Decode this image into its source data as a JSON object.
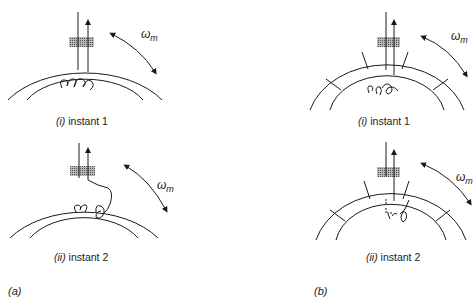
{
  "figure": {
    "panels": [
      {
        "id": "a",
        "label": "(a)",
        "description": "unslotted rotor / stator",
        "instants": [
          {
            "roman": "(i)",
            "text": "instant 1",
            "rotation_label": "ω",
            "rotation_sub": "m"
          },
          {
            "roman": "(ii)",
            "text": "instant 2",
            "rotation_label": "ω",
            "rotation_sub": "m"
          }
        ]
      },
      {
        "id": "b",
        "label": "(b)",
        "description": "slotted ring with radial divisions",
        "instants": [
          {
            "roman": "(i)",
            "text": "instant 1",
            "rotation_label": "ω",
            "rotation_sub": "m"
          },
          {
            "roman": "(ii)",
            "text": "instant 2",
            "rotation_label": "ω",
            "rotation_sub": "m"
          }
        ]
      }
    ],
    "colors": {
      "line": "#1a1a1a",
      "hatch": "#8a8a8a",
      "background": "#ffffff"
    }
  }
}
